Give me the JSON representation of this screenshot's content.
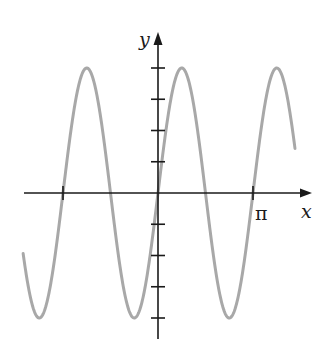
{
  "chart_data": {
    "type": "line",
    "title": "",
    "function": "y = 4 sin(2x)",
    "xlabel": "x",
    "ylabel": "y",
    "x_tick_labels": [
      {
        "value": 3.14159,
        "label": "π"
      }
    ],
    "x_ticks": [
      -3.14159,
      3.14159
    ],
    "y_ticks": [
      -4,
      -3,
      -2,
      -1,
      1,
      2,
      3,
      4
    ],
    "xlim": [
      -4.46,
      4.53
    ],
    "ylim": [
      -4,
      4
    ],
    "grid": false,
    "legend": null,
    "series": [
      {
        "name": "curve",
        "color": "#a8a8a8",
        "amplitude": 4,
        "period": 3.14159,
        "x_range": [
          -4.46,
          4.53
        ]
      }
    ]
  },
  "labels": {
    "x_axis": "x",
    "y_axis": "y",
    "pi_tick": "π"
  },
  "colors": {
    "axis": "#1a1a1a",
    "curve": "#a8a8a8"
  }
}
